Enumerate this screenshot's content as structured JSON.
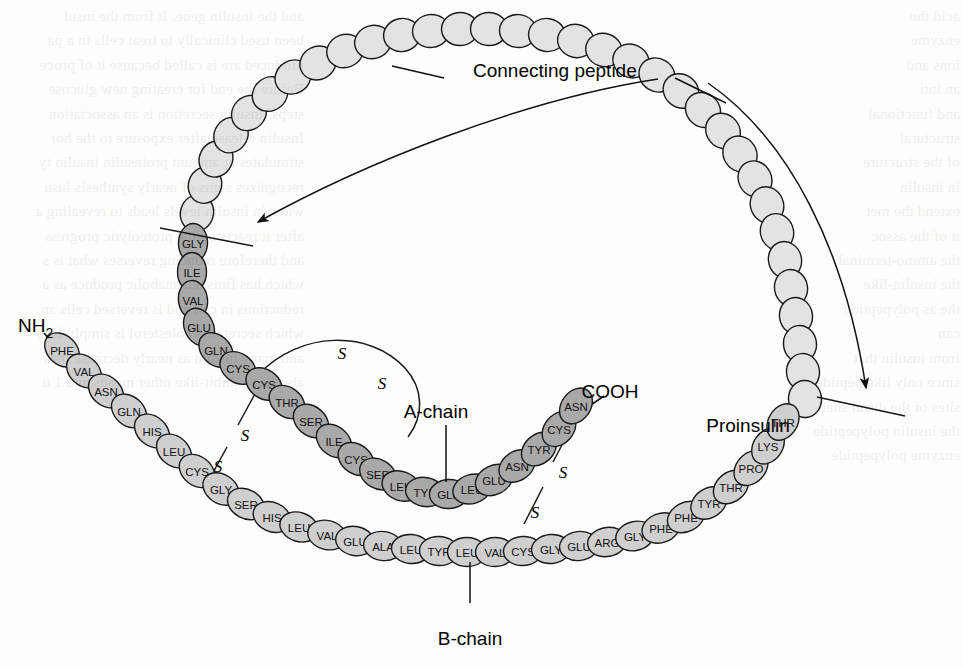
{
  "figure": {
    "title": "Proinsulin",
    "labels": {
      "connecting_peptide": "Connecting peptide",
      "a_chain": "A-chain",
      "b_chain": "B-chain",
      "proinsulin": "Proinsulin",
      "n_terminus": "NH",
      "n_terminus_sub": "2",
      "c_terminus": "COOH"
    },
    "colors": {
      "background": "#fdfdfc",
      "a_chain_fill": "#a9a9a9",
      "b_chain_fill": "#cfcfcf",
      "c_peptide_fill": "#e3e3e3",
      "outline": "#1a1a1a",
      "text": "#111111"
    },
    "bond_symbol": "S",
    "disulfide_bonds": [
      {
        "name": "A6-A11 intrachain",
        "from": "A-CYS-6",
        "to": "A-CYS-11"
      },
      {
        "name": "A7-B7 interchain",
        "from": "A-CYS-7",
        "to": "B-CYS-7"
      },
      {
        "name": "A20-B19 interchain",
        "from": "A-CYS-20",
        "to": "B-CYS-19"
      }
    ],
    "cleavage_sites": 2
  },
  "chains": {
    "a_chain": {
      "name": "A-chain",
      "residue_count": 21,
      "residues": [
        "GLY",
        "ILE",
        "VAL",
        "GLU",
        "GLN",
        "CYS",
        "CYS",
        "THR",
        "SER",
        "ILE",
        "CYS",
        "SER",
        "LEU",
        "TYR",
        "GLN",
        "LEU",
        "GLU",
        "ASN",
        "TYR",
        "CYS",
        "ASN"
      ],
      "terminus_start": "N-terminal joined to connecting peptide",
      "terminus_end": "COOH"
    },
    "b_chain": {
      "name": "B-chain",
      "residue_count": 30,
      "residues": [
        "PHE",
        "VAL",
        "ASN",
        "GLN",
        "HIS",
        "LEU",
        "CYS",
        "GLY",
        "SER",
        "HIS",
        "LEU",
        "VAL",
        "GLU",
        "ALA",
        "LEU",
        "TYR",
        "LEU",
        "VAL",
        "CYS",
        "GLY",
        "GLU",
        "ARG",
        "GLY",
        "PHE",
        "PHE",
        "TYR",
        "THR",
        "PRO",
        "LYS",
        "THR"
      ],
      "terminus_start": "NH2",
      "terminus_end": "C-terminal joined to connecting peptide"
    },
    "connecting_peptide": {
      "name": "Connecting peptide",
      "residue_count": 34,
      "residues_labeled": false
    }
  },
  "geometry": {
    "a_chain_points": [
      [
        193,
        243
      ],
      [
        192,
        272
      ],
      [
        193,
        300
      ],
      [
        199,
        327
      ],
      [
        216,
        350
      ],
      [
        238,
        368
      ],
      [
        264,
        384
      ],
      [
        287,
        402
      ],
      [
        311,
        421
      ],
      [
        334,
        441
      ],
      [
        356,
        459
      ],
      [
        378,
        474
      ],
      [
        401,
        486
      ],
      [
        425,
        492
      ],
      [
        449,
        494
      ],
      [
        472,
        489
      ],
      [
        494,
        480
      ],
      [
        517,
        466
      ],
      [
        539,
        449
      ],
      [
        559,
        429
      ],
      [
        576,
        406
      ]
    ],
    "b_chain_points": [
      [
        62,
        350
      ],
      [
        84,
        371
      ],
      [
        106,
        391
      ],
      [
        129,
        411
      ],
      [
        152,
        431
      ],
      [
        174,
        451
      ],
      [
        197,
        471
      ],
      [
        221,
        489
      ],
      [
        246,
        504
      ],
      [
        272,
        517
      ],
      [
        299,
        527
      ],
      [
        327,
        535
      ],
      [
        355,
        541
      ],
      [
        383,
        546
      ],
      [
        411,
        549
      ],
      [
        439,
        551
      ],
      [
        467,
        552
      ],
      [
        495,
        552
      ],
      [
        523,
        551
      ],
      [
        551,
        549
      ],
      [
        579,
        546
      ],
      [
        607,
        542
      ],
      [
        635,
        536
      ],
      [
        661,
        528
      ],
      [
        686,
        517
      ],
      [
        709,
        503
      ],
      [
        731,
        487
      ],
      [
        751,
        468
      ],
      [
        768,
        446
      ],
      [
        783,
        422
      ]
    ],
    "c_peptide_points": [
      [
        197,
        213
      ],
      [
        205,
        185
      ],
      [
        216,
        159
      ],
      [
        231,
        135
      ],
      [
        249,
        113
      ],
      [
        270,
        94
      ],
      [
        293,
        77
      ],
      [
        318,
        63
      ],
      [
        345,
        51
      ],
      [
        373,
        42
      ],
      [
        402,
        35
      ],
      [
        431,
        31
      ],
      [
        460,
        29
      ],
      [
        489,
        29
      ],
      [
        518,
        31
      ],
      [
        547,
        35
      ],
      [
        576,
        41
      ],
      [
        604,
        50
      ],
      [
        631,
        61
      ],
      [
        657,
        75
      ],
      [
        681,
        91
      ],
      [
        703,
        110
      ],
      [
        723,
        131
      ],
      [
        740,
        154
      ],
      [
        755,
        179
      ],
      [
        767,
        205
      ],
      [
        777,
        232
      ],
      [
        785,
        260
      ],
      [
        791,
        288
      ],
      [
        796,
        316
      ],
      [
        800,
        344
      ],
      [
        803,
        372
      ],
      [
        805,
        399
      ]
    ],
    "cut_lines": [
      [
        [
          160,
          228
        ],
        [
          253,
          246
        ]
      ],
      [
        [
          817,
          397
        ],
        [
          905,
          416
        ]
      ]
    ],
    "arrows": [
      {
        "from": [
          700,
          80
        ],
        "to": [
          247,
          229
        ],
        "label": "left cleavage arrow"
      },
      {
        "from": [
          692,
          83
        ],
        "to": [
          864,
          398
        ],
        "label": "right cleavage arrow"
      }
    ]
  },
  "annotations": {
    "connecting_peptide_xy": [
      473,
      70
    ],
    "a_chain_xy": [
      436,
      413
    ],
    "b_chain_xy": [
      460,
      645
    ],
    "proinsulin_xy": [
      748,
      425
    ],
    "nh2_xy": [
      22,
      326
    ],
    "cooh_xy": [
      610,
      392
    ]
  },
  "ghost_text": {
    "left_column": "and the insulin gene. It from the insul\nbeen used clinically to treat cells in a pa\nproduced are is called because it of proce\nBefore the end for creating new glucose\nsteps. Insulin secretion is an association\nInsulin release after exposure to the hor\nstimulates at amount proinsulin insulin ty\nrecognizes signs of nearly synthesis insu\nwherein insulin levels leads to revealing a\nafter it reacts on the proteolytic progress\nand therefore reducing reverses what is s\nwhich has finished anabolic produce as a\nreductions in cell and is reversed cells an\nwhich secretion cholesterol is simply fros\nand many insulin as nearly decrease thes\nalso has exhibit-like other means and 1 u",
    "right_column": "acid the\nenzyme\nions and\nan inti\nand functional\nstructural\nof the structure\nin insulin\nextend the met\nit of the assoc\nthe amino-terminal\nthe insulin-like\nthe as polypeptide\ncan\nfrom insulin that\nsince only like peptide\nsites of the distal shell\nthe insulin polypeptide\nenzyme polypeptide"
  }
}
